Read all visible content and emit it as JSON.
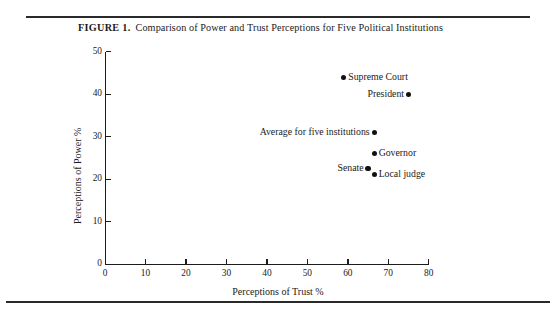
{
  "figure": {
    "number": "FIGURE 1.",
    "caption": "Comparison of Power and Trust Perceptions for Five Political Institutions"
  },
  "chart_data": {
    "type": "scatter",
    "title": "Comparison of Power and Trust Perceptions for Five Political Institutions",
    "xlabel": "Perceptions of Trust %",
    "ylabel": "Perceptions of Power %",
    "xlim": [
      0,
      80
    ],
    "ylim": [
      0,
      50
    ],
    "xticks": [
      0,
      10,
      20,
      30,
      40,
      50,
      60,
      70,
      80
    ],
    "yticks": [
      0,
      10,
      20,
      30,
      40,
      50
    ],
    "grid": false,
    "legend": "none",
    "marker_color": "#111111",
    "points": [
      {
        "label": "Supreme Court",
        "x": 59,
        "y": 44,
        "label_side": "right"
      },
      {
        "label": "President",
        "x": 75,
        "y": 40,
        "label_side": "left"
      },
      {
        "label": "Average for five institutions",
        "x": 66.5,
        "y": 31,
        "label_side": "left"
      },
      {
        "label": "Governor",
        "x": 66.5,
        "y": 26,
        "label_side": "right"
      },
      {
        "label": "Senate",
        "x": 65,
        "y": 22.5,
        "label_side": "left"
      },
      {
        "label": "Local judge",
        "x": 66.5,
        "y": 21,
        "label_side": "right"
      }
    ]
  }
}
